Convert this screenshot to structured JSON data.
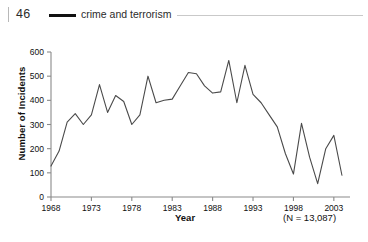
{
  "header": {
    "folio": "46",
    "running_title": "crime and terrorism"
  },
  "chart_data": {
    "type": "line",
    "title": "",
    "xlabel": "Year",
    "ylabel": "Number of Incidents",
    "annotation": "(N = 13,087)",
    "xlim": [
      1968,
      2005
    ],
    "ylim": [
      0,
      600
    ],
    "grid": false,
    "legend": null,
    "ytick_labels": [
      "0",
      "100",
      "200",
      "300",
      "400",
      "500",
      "600"
    ],
    "yticks": [
      0,
      100,
      200,
      300,
      400,
      500,
      600
    ],
    "xtick_labels": [
      "1968",
      "1973",
      "1978",
      "1983",
      "1988",
      "1993",
      "1998",
      "2003"
    ],
    "xticks": [
      1968,
      1973,
      1978,
      1983,
      1988,
      1993,
      1998,
      2003
    ],
    "series": [
      {
        "name": "incidents",
        "color": "#4a4a4a",
        "x": [
          1968,
          1969,
          1970,
          1971,
          1972,
          1973,
          1974,
          1975,
          1976,
          1977,
          1978,
          1979,
          1980,
          1981,
          1982,
          1983,
          1984,
          1985,
          1986,
          1987,
          1988,
          1989,
          1990,
          1991,
          1992,
          1993,
          1994,
          1995,
          1996,
          1997,
          1998,
          1999,
          2000,
          2001,
          2002,
          2003,
          2004
        ],
        "values": [
          128,
          190,
          310,
          345,
          300,
          340,
          465,
          350,
          420,
          395,
          300,
          340,
          500,
          390,
          400,
          405,
          460,
          515,
          510,
          460,
          430,
          435,
          565,
          390,
          545,
          425,
          390,
          340,
          290,
          180,
          95,
          305,
          165,
          55,
          200,
          255,
          90
        ],
        "y": [
          128,
          190,
          310,
          345,
          300,
          340,
          465,
          350,
          420,
          395,
          300,
          340,
          500,
          390,
          400,
          405,
          460,
          515,
          510,
          460,
          430,
          435,
          565,
          390,
          545,
          425,
          390,
          340,
          290,
          180,
          95,
          305,
          165,
          55,
          200,
          255,
          90
        ]
      }
    ]
  }
}
